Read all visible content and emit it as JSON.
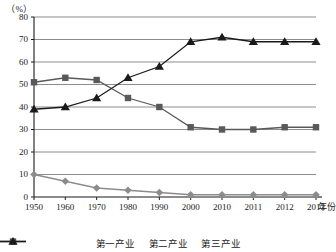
{
  "chart_data": {
    "type": "line",
    "title": "",
    "unit_label": "（%）",
    "xlabel": "年份",
    "ylabel": "",
    "grid": true,
    "legend_position": "bottom",
    "ylim": [
      0,
      80
    ],
    "yticks": [
      0,
      10,
      20,
      30,
      40,
      50,
      60,
      70,
      80
    ],
    "categories": [
      "1950",
      "1960",
      "1970",
      "1980",
      "1990",
      "2000",
      "2010",
      "2011",
      "2012",
      "2013"
    ],
    "series": [
      {
        "name": "第一产业",
        "marker": "diamond",
        "color": "#8c8c8c",
        "values": [
          10,
          7,
          4,
          3,
          2,
          1,
          1,
          1,
          1,
          1
        ]
      },
      {
        "name": "第二产业",
        "marker": "square",
        "color": "#595959",
        "values": [
          51,
          53,
          52,
          44,
          40,
          31,
          30,
          30,
          31,
          31
        ]
      },
      {
        "name": "第三产业",
        "marker": "triangle",
        "color": "#1a1a1a",
        "values": [
          39,
          40,
          44,
          53,
          58,
          69,
          71,
          69,
          69,
          69
        ]
      }
    ]
  },
  "axis": {
    "x_tick_labels": [
      "1950",
      "1960",
      "1970",
      "1980",
      "1990",
      "2000",
      "2010",
      "2011",
      "2012",
      "2013"
    ],
    "y_tick_labels": [
      "80",
      "70",
      "60",
      "50",
      "40",
      "30",
      "20",
      "10",
      "0"
    ],
    "x_title": "年份",
    "y_unit": "（%）"
  },
  "legend": {
    "items": [
      {
        "label": "第一产业",
        "marker": "diamond-marker",
        "color": "#8c8c8c"
      },
      {
        "label": "第二产业",
        "marker": "square-marker",
        "color": "#595959"
      },
      {
        "label": "第三产业",
        "marker": "triangle-marker",
        "color": "#1a1a1a"
      }
    ]
  }
}
